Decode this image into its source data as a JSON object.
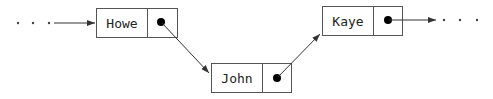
{
  "diagram": {
    "type": "linked-list",
    "nodes": [
      {
        "id": "howe",
        "label": "Howe",
        "x": 96,
        "y": 8,
        "w": 81,
        "h": 29,
        "div": 51
      },
      {
        "id": "john",
        "label": "John",
        "x": 211,
        "y": 63,
        "w": 80,
        "h": 29,
        "div": 51
      },
      {
        "id": "kaye",
        "label": "Kaye",
        "x": 322,
        "y": 6,
        "w": 80,
        "h": 29,
        "div": 51
      }
    ],
    "edges": [
      {
        "from": "start",
        "to": "howe"
      },
      {
        "from": "howe",
        "to": "john"
      },
      {
        "from": "john",
        "to": "kaye"
      },
      {
        "from": "kaye",
        "to": "end"
      }
    ],
    "ellipsis_left": "...",
    "ellipsis_right": "...",
    "colors": {
      "stroke": "#555555",
      "text": "#222222",
      "pointer": "#000000"
    }
  }
}
